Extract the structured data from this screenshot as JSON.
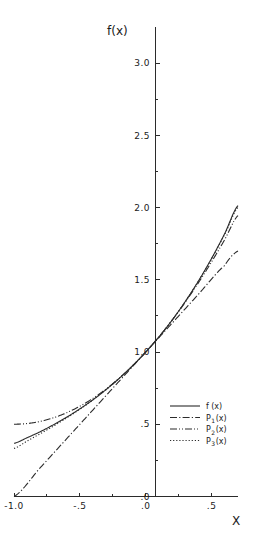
{
  "chart_data": {
    "type": "line",
    "title": "",
    "xlabel": "X",
    "ylabel": "f(x)",
    "xlim": [
      -1.0,
      0.7
    ],
    "ylim": [
      0.0,
      3.25
    ],
    "grid": false,
    "legend_position": "lower-right-inside",
    "x_ticks": [
      {
        "value": -1.0,
        "label": "-1.0",
        "major": true
      },
      {
        "value": -0.75,
        "label": "",
        "major": false
      },
      {
        "value": -0.5,
        "label": "-.5",
        "major": true
      },
      {
        "value": -0.25,
        "label": "",
        "major": false
      },
      {
        "value": 0.0,
        "label": ".0",
        "major": true
      },
      {
        "value": 0.25,
        "label": "",
        "major": false
      },
      {
        "value": 0.5,
        "label": ".5",
        "major": true
      }
    ],
    "y_ticks": [
      {
        "value": 0.0,
        "label": ".0",
        "major": true
      },
      {
        "value": 0.25,
        "label": "",
        "major": false
      },
      {
        "value": 0.5,
        "label": ".5",
        "major": true
      },
      {
        "value": 0.75,
        "label": "",
        "major": false
      },
      {
        "value": 1.0,
        "label": "1.0",
        "major": true
      },
      {
        "value": 1.25,
        "label": "",
        "major": false
      },
      {
        "value": 1.5,
        "label": "1.5",
        "major": true
      },
      {
        "value": 1.75,
        "label": "",
        "major": false
      },
      {
        "value": 2.0,
        "label": "2.0",
        "major": true
      },
      {
        "value": 2.25,
        "label": "",
        "major": false
      },
      {
        "value": 2.5,
        "label": "2.5",
        "major": true
      },
      {
        "value": 2.75,
        "label": "",
        "major": false
      },
      {
        "value": 3.0,
        "label": "3.0",
        "major": true
      }
    ],
    "series": [
      {
        "name": "f(x)",
        "legend_label": "f(x)",
        "legend_base": "f",
        "legend_sub": "",
        "legend_suffix": "(x)",
        "style": "solid",
        "formula": "exp(x)",
        "x": [
          -1.0,
          -0.9,
          -0.8,
          -0.7,
          -0.6,
          -0.5,
          -0.4,
          -0.3,
          -0.2,
          -0.1,
          0.0,
          0.1,
          0.2,
          0.3,
          0.4,
          0.5,
          0.6,
          0.7
        ],
        "y": [
          0.368,
          0.407,
          0.449,
          0.497,
          0.549,
          0.607,
          0.67,
          0.741,
          0.819,
          0.905,
          1.0,
          1.105,
          1.221,
          1.35,
          1.492,
          1.649,
          1.822,
          2.014
        ]
      },
      {
        "name": "P1(x)",
        "legend_label": "P1 (x)",
        "legend_base": "P",
        "legend_sub": "1",
        "legend_suffix": "(x)",
        "style": "dash-dot",
        "formula": "1 + x",
        "x": [
          -1.0,
          -0.8,
          -0.6,
          -0.4,
          -0.2,
          0.0,
          0.2,
          0.4,
          0.6,
          0.7
        ],
        "y": [
          0.0,
          0.2,
          0.4,
          0.6,
          0.8,
          1.0,
          1.2,
          1.4,
          1.6,
          1.7
        ]
      },
      {
        "name": "P2(x)",
        "legend_label": "P2 (x)",
        "legend_base": "P",
        "legend_sub": "2",
        "legend_suffix": "(x)",
        "style": "dash-dot-dot",
        "formula": "1 + x + x^2/2",
        "x": [
          -1.0,
          -0.9,
          -0.8,
          -0.7,
          -0.6,
          -0.5,
          -0.4,
          -0.3,
          -0.2,
          -0.1,
          0.0,
          0.1,
          0.2,
          0.3,
          0.4,
          0.5,
          0.6,
          0.7
        ],
        "y": [
          0.5,
          0.505,
          0.52,
          0.545,
          0.58,
          0.625,
          0.68,
          0.745,
          0.82,
          0.905,
          1.0,
          1.105,
          1.22,
          1.345,
          1.48,
          1.625,
          1.78,
          1.945
        ]
      },
      {
        "name": "P3(x)",
        "legend_label": "P3 (x)",
        "legend_base": "P",
        "legend_sub": "3",
        "legend_suffix": "(x)",
        "style": "dotted",
        "formula": "1 + x + x^2/2 + x^3/6",
        "x": [
          -1.0,
          -0.9,
          -0.8,
          -0.7,
          -0.6,
          -0.5,
          -0.4,
          -0.3,
          -0.2,
          -0.1,
          0.0,
          0.1,
          0.2,
          0.3,
          0.4,
          0.5,
          0.6,
          0.7
        ],
        "y": [
          0.333,
          0.384,
          0.435,
          0.488,
          0.544,
          0.604,
          0.669,
          0.741,
          0.819,
          0.905,
          1.0,
          1.105,
          1.221,
          1.35,
          1.491,
          1.646,
          1.816,
          2.002
        ]
      }
    ]
  },
  "axes": {
    "y_axis_title": "f(x)",
    "x_axis_title": "X"
  },
  "legend": {
    "entries": [
      {
        "label": "f(x)",
        "base": "f",
        "sub": "",
        "suffix": "(x)",
        "style": "solid"
      },
      {
        "label": "P1 (x)",
        "base": "P",
        "sub": "1",
        "suffix": "(x)",
        "style": "dash-dot"
      },
      {
        "label": "P2 (x)",
        "base": "P",
        "sub": "2",
        "suffix": "(x)",
        "style": "dash-dot-dot"
      },
      {
        "label": "P3 (x)",
        "base": "P",
        "sub": "3",
        "suffix": "(x)",
        "style": "dotted"
      }
    ]
  },
  "colors": {
    "ink": "#2b2b2b",
    "background": "#ffffff"
  }
}
